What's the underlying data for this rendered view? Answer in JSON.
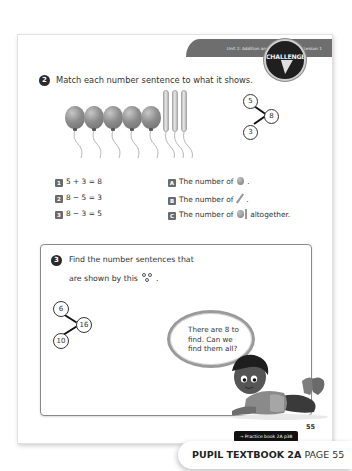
{
  "header": {
    "unit_banner": "Unit 2: Addition and subtraction (1), Lesson 1"
  },
  "question2": {
    "number": "2",
    "prompt": "Match each number sentence to what it shows.",
    "illustration": {
      "round_balloons": 5,
      "long_balloons": 3
    },
    "number_bond": {
      "parts": [
        "5",
        "3"
      ],
      "whole": "8"
    },
    "sentences": [
      {
        "tag": "1",
        "text": "5 + 3 = 8"
      },
      {
        "tag": "2",
        "text": "8 − 5 = 3"
      },
      {
        "tag": "3",
        "text": "8 − 3 = 5"
      }
    ],
    "descriptions": [
      {
        "tag": "A",
        "text": "The number of",
        "icon": "round-balloon-icon",
        "suffix": "."
      },
      {
        "tag": "B",
        "text": "The number of",
        "icon": "long-balloon-icon",
        "suffix": "."
      },
      {
        "tag": "C",
        "text": "The number of",
        "icon": "both-balloons-icon",
        "suffix": "altogether."
      }
    ]
  },
  "question3": {
    "number": "3",
    "prompt_line1": "Find the number sentences that",
    "prompt_line2": "are shown by this",
    "prompt_suffix": ".",
    "badge_label": "CHALLENGE",
    "number_bond": {
      "parts": [
        "6",
        "10"
      ],
      "whole": "16"
    },
    "speech": "There are 8 to find. Can we find them all?"
  },
  "footer": {
    "practice_link": "→ Practice book 2A p38",
    "page_number": "55",
    "book_label": "PUPIL TEXTBOOK 2A",
    "page_label": "PAGE 55"
  }
}
